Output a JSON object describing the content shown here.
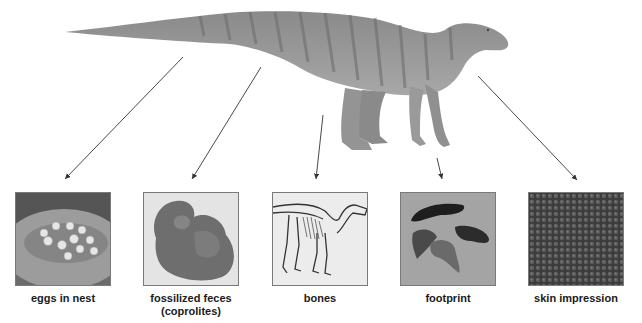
{
  "diagram": {
    "fossil_types": [
      {
        "id": "eggs",
        "label": "eggs in nest",
        "sublabel": ""
      },
      {
        "id": "coprolites",
        "label": "fossilized feces",
        "sublabel": "(coprolites)"
      },
      {
        "id": "bones",
        "label": "bones",
        "sublabel": ""
      },
      {
        "id": "footprint",
        "label": "footprint",
        "sublabel": ""
      },
      {
        "id": "skin",
        "label": "skin impression",
        "sublabel": ""
      }
    ],
    "colors": {
      "arrow": "#333333",
      "dino_body": "#8e8e8e",
      "dino_stripes": "#6a6a6a",
      "panel_border": "#7a7a7a"
    }
  }
}
